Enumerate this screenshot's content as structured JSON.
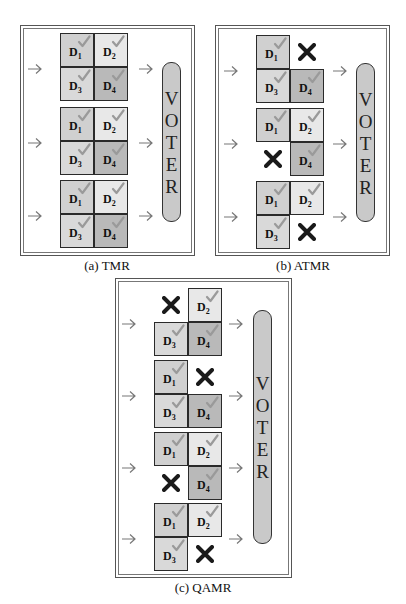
{
  "colors": {
    "D1": "#d0d0d0",
    "D2": "#e8e8e8",
    "D3": "#d9d9d9",
    "D4": "#b9b9b9",
    "check": "#9a9a9a",
    "cross": "#1a1a1a",
    "voter": "#c9c9c9"
  },
  "panels": [
    {
      "id": "a",
      "caption": "(a) TMR",
      "voter_label": "VOTER",
      "modules": [
        {
          "cells": [
            "D1",
            "D2",
            "D3",
            "D4"
          ],
          "failed": []
        },
        {
          "cells": [
            "D1",
            "D2",
            "D3",
            "D4"
          ],
          "failed": []
        },
        {
          "cells": [
            "D1",
            "D2",
            "D3",
            "D4"
          ],
          "failed": []
        }
      ]
    },
    {
      "id": "b",
      "caption": "(b) ATMR",
      "voter_label": "VOTER",
      "modules": [
        {
          "cells": [
            "D1",
            "D2",
            "D3",
            "D4"
          ],
          "failed": [
            "D2"
          ]
        },
        {
          "cells": [
            "D1",
            "D2",
            "D3",
            "D4"
          ],
          "failed": [
            "D3"
          ]
        },
        {
          "cells": [
            "D1",
            "D2",
            "D3",
            "D4"
          ],
          "failed": [
            "D4"
          ]
        }
      ]
    },
    {
      "id": "c",
      "caption": "(c) QAMR",
      "voter_label": "VOTER",
      "modules": [
        {
          "cells": [
            "D1",
            "D2",
            "D3",
            "D4"
          ],
          "failed": [
            "D1"
          ]
        },
        {
          "cells": [
            "D1",
            "D2",
            "D3",
            "D4"
          ],
          "failed": [
            "D2"
          ]
        },
        {
          "cells": [
            "D1",
            "D2",
            "D3",
            "D4"
          ],
          "failed": [
            "D3"
          ]
        },
        {
          "cells": [
            "D1",
            "D2",
            "D3",
            "D4"
          ],
          "failed": [
            "D4"
          ]
        }
      ]
    }
  ],
  "labels": {
    "a": {
      "caption": "(a) TMR",
      "voter": [
        "V",
        "O",
        "T",
        "E",
        "R"
      ]
    },
    "b": {
      "caption": "(b) ATMR",
      "voter": [
        "V",
        "O",
        "T",
        "E",
        "R"
      ]
    },
    "c": {
      "caption": "(c) QAMR",
      "voter": [
        "V",
        "O",
        "T",
        "E",
        "R"
      ]
    },
    "cell": {
      "D1": {
        "base": "D",
        "sub": "1"
      },
      "D2": {
        "base": "D",
        "sub": "2"
      },
      "D3": {
        "base": "D",
        "sub": "3"
      },
      "D4": {
        "base": "D",
        "sub": "4"
      }
    }
  },
  "icons": {
    "input_arrow": "arrow-right-icon",
    "output_arrow": "arrow-right-icon",
    "ok": "check-icon",
    "fault": "cross-icon"
  }
}
